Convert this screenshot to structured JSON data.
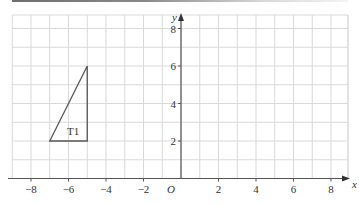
{
  "figure": {
    "type": "coordinate-grid",
    "x_axis": {
      "label": "x",
      "min": -9,
      "max": 9,
      "ticks": [
        -8,
        -6,
        -4,
        -2,
        2,
        4,
        6,
        8
      ],
      "tick_labels": [
        "−8",
        "−6",
        "−4",
        "−2",
        "2",
        "4",
        "6",
        "8"
      ]
    },
    "y_axis": {
      "label": "y",
      "min": 0,
      "max": 8.7,
      "ticks": [
        2,
        4,
        6,
        8
      ],
      "tick_labels": [
        "2",
        "4",
        "6",
        "8"
      ]
    },
    "origin_label": "O",
    "grid": true,
    "shapes": [
      {
        "name": "T1",
        "label": "T1",
        "type": "triangle",
        "vertices": [
          [
            -7,
            2
          ],
          [
            -5,
            2
          ],
          [
            -5,
            6
          ]
        ],
        "label_position": [
          -5.75,
          2.55
        ]
      }
    ]
  },
  "colors": {
    "grid": "#d9d9d9",
    "axis": "#555555",
    "shape": "#555555",
    "text": "#333333"
  }
}
